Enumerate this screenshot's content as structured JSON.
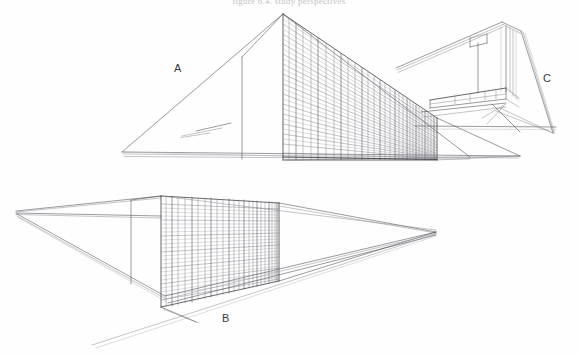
{
  "page": {
    "kind": "scanned-architectural-drawing-sheet",
    "background_color": "#fefefe",
    "ink_color": "#4a4a50",
    "width": 578,
    "height": 356
  },
  "header": {
    "caption": "figure 6.4. study perspectives"
  },
  "labels": {
    "a": "A",
    "b": "B",
    "c": "C"
  },
  "drawings": [
    {
      "id": "a",
      "label": "A",
      "title": "upper-left perspective",
      "description": "two-point perspective of a long slab building; left ground plane converging to a far-left vanishing point, tall gridded curtain-wall facade at right",
      "apex": [
        283,
        14
      ],
      "left_vanishing_point": [
        122,
        152
      ],
      "right_vanishing_point": [
        520,
        156
      ],
      "facade_floors": 14,
      "facade_bays": 13
    },
    {
      "id": "b",
      "label": "B",
      "title": "lower perspective",
      "description": "wide low-angle two-point perspective of the same slab; gridded facade centred, long ground lines converging left and right",
      "left_vanishing_point": [
        16,
        211
      ],
      "right_vanishing_point": [
        436,
        232
      ],
      "facade_floors": 13,
      "facade_bays": 14
    },
    {
      "id": "c",
      "label": "C",
      "title": "upper-right detail perspective",
      "description": "small worm's-eye perspective of the slab end with a tilted overhanging roof plane and a low podium block",
      "ground_vanishing_point": [
        553,
        133
      ]
    }
  ],
  "colors": {
    "ink": "#4a4a50",
    "ink_light": "#8a8a92",
    "ink_faint": "#b5b5bc",
    "paper": "#fefefe",
    "label": "#3a3a3c"
  }
}
